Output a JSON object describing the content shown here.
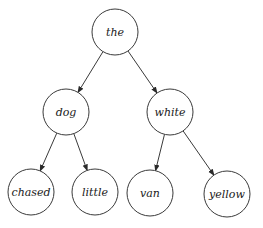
{
  "diagram": {
    "type": "tree",
    "title": "",
    "colors": {
      "stroke": "#3a3a3a",
      "text": "#1a1a1a",
      "background": "#ffffff"
    },
    "nodes": [
      {
        "id": "the",
        "label": "the",
        "cx": 115,
        "cy": 32,
        "r": 23
      },
      {
        "id": "dog",
        "label": "dog",
        "cx": 66,
        "cy": 112,
        "r": 23
      },
      {
        "id": "white",
        "label": "white",
        "cx": 170,
        "cy": 112,
        "r": 23
      },
      {
        "id": "chased",
        "label": "chased",
        "cx": 31,
        "cy": 192,
        "r": 23
      },
      {
        "id": "little",
        "label": "little",
        "cx": 95,
        "cy": 192,
        "r": 23
      },
      {
        "id": "van",
        "label": "van",
        "cx": 150,
        "cy": 193,
        "r": 23
      },
      {
        "id": "yellow",
        "label": "yellow",
        "cx": 227,
        "cy": 194,
        "r": 23
      }
    ],
    "edges": [
      {
        "from": "the",
        "to": "dog",
        "directed": true
      },
      {
        "from": "the",
        "to": "white",
        "directed": true
      },
      {
        "from": "dog",
        "to": "chased",
        "directed": true
      },
      {
        "from": "dog",
        "to": "little",
        "directed": true
      },
      {
        "from": "white",
        "to": "van",
        "directed": true
      },
      {
        "from": "white",
        "to": "yellow",
        "directed": true
      }
    ]
  }
}
